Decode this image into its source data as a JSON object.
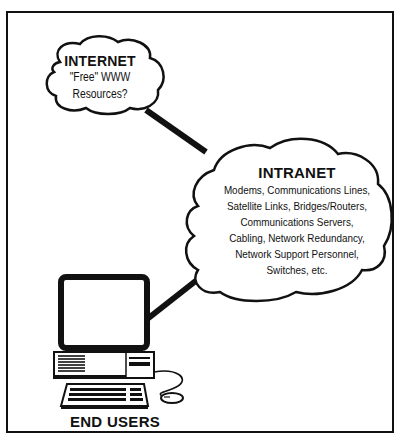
{
  "diagram": {
    "nodes": [
      {
        "id": "internet",
        "shape": "cloud",
        "title": "INTERNET",
        "lines": [
          "\"Free\" WWW",
          "Resources?"
        ]
      },
      {
        "id": "intranet",
        "shape": "cloud",
        "title": "INTRANET",
        "lines": [
          "Modems, Communications Lines,",
          "Satellite Links, Bridges/Routers,",
          "Communications Servers,",
          "Cabling, Network Redundancy,",
          "Network Support Personnel,",
          "Switches, etc."
        ]
      },
      {
        "id": "end-users",
        "shape": "computer-icon",
        "title": "END USERS"
      }
    ],
    "edges": [
      {
        "from": "internet",
        "to": "intranet"
      },
      {
        "from": "intranet",
        "to": "end-users"
      }
    ],
    "colors": {
      "stroke": "#111111",
      "fill": "#ffffff",
      "background": "#ffffff"
    }
  }
}
